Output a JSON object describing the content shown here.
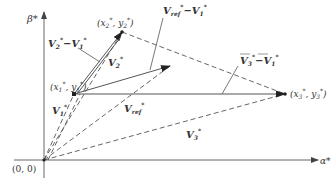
{
  "diagram": {
    "axes": {
      "x_label": "α*",
      "y_label": "β*",
      "origin_label": "(0, 0)"
    },
    "points": {
      "p1": {
        "label_x": "x",
        "label_y": "y",
        "index": "1",
        "text": "(x1*, y1*)"
      },
      "p2": {
        "label_x": "x",
        "label_y": "y",
        "index": "2",
        "text": "(x2*, y2*)"
      },
      "p3": {
        "label_x": "x",
        "label_y": "y",
        "index": "3",
        "text": "(x3*, y3*)"
      }
    },
    "vectors": {
      "v1": {
        "main": "V",
        "sub": "1",
        "sup": "*"
      },
      "v2": {
        "main": "V",
        "sub": "2",
        "sup": "*"
      },
      "v3": {
        "main": "V",
        "sub": "3",
        "sup": "*"
      },
      "vref": {
        "main": "V",
        "sub": "ref",
        "sup": "*"
      },
      "v2_minus_v1": {
        "text": "V2* − V1*"
      },
      "vref_minus_v1": {
        "text": "Vref* − V1*"
      },
      "v3_minus_v1": {
        "text": "V3* − V1*"
      }
    },
    "colors": {
      "line": "#555555",
      "text": "#333333",
      "background": "#ffffff"
    }
  }
}
